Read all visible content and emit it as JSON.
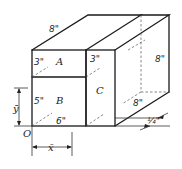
{
  "diagram": {
    "type": "isometric composite solid",
    "parts": [
      {
        "id": "A",
        "label": "A",
        "height": "3\""
      },
      {
        "id": "B",
        "label": "B",
        "height": "5\""
      },
      {
        "id": "C",
        "label": "C",
        "height": "3\""
      }
    ],
    "dimensions": {
      "top_depth": "8\"",
      "part_a_height": "3\"",
      "part_b_height": "5\"",
      "front_width": "6\"",
      "part_c_width": "3\"",
      "back_height": "8\"",
      "bottom_depth": "8\"",
      "plate_thickness": "¼\""
    },
    "origin_label": "O",
    "centroid_x_label": "x̄",
    "centroid_y_label": "ȳ"
  }
}
